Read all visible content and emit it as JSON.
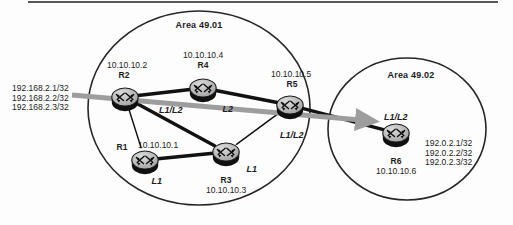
{
  "figure": {
    "type": "network-topology-diagram",
    "background": "#fdfdfd",
    "ink_color": "#1b1b1b",
    "link_color": "#111111",
    "arrow_color": "#9a9a9a",
    "router_body_color": "#b3b3b3",
    "router_shadow_color": "#101010"
  },
  "areas": [
    {
      "id": "area-49-01",
      "label": "Area 49.01",
      "cx": 199,
      "cy": 108,
      "rx": 111,
      "ry": 97,
      "label_x": 199,
      "label_y": 20
    },
    {
      "id": "area-49-02",
      "label": "Area 49.02",
      "cx": 407,
      "cy": 129,
      "rx": 79,
      "ry": 71,
      "label_x": 411,
      "label_y": 70
    }
  ],
  "routers": [
    {
      "id": "R1",
      "name": "R1",
      "x": 145,
      "y": 160,
      "name_x": 122,
      "name_y": 143,
      "ip": "10.10.10.1",
      "ip_x": 158,
      "ip_y": 141,
      "level": "L1",
      "level_x": 157,
      "level_y": 176
    },
    {
      "id": "R2",
      "name": "R2",
      "x": 125,
      "y": 97,
      "name_x": 124,
      "name_y": 71,
      "ip": "10.10.10.2",
      "ip_x": 127,
      "ip_y": 61,
      "level": "L1/L2",
      "level_x": 171,
      "level_y": 105
    },
    {
      "id": "R3",
      "name": "R3",
      "x": 226,
      "y": 152,
      "name_x": 226,
      "name_y": 176,
      "ip": "10.10.10.3",
      "ip_x": 226,
      "ip_y": 186,
      "level": "L1",
      "level_x": 252,
      "level_y": 164
    },
    {
      "id": "R4",
      "name": "R4",
      "x": 203,
      "y": 88,
      "name_x": 203,
      "name_y": 61,
      "ip": "10.10.10.4",
      "ip_x": 203,
      "ip_y": 51,
      "level": "L2",
      "level_x": 228,
      "level_y": 104
    },
    {
      "id": "R5",
      "name": "R5",
      "x": 290,
      "y": 105,
      "name_x": 292,
      "name_y": 80,
      "ip": "10.10.10.5",
      "ip_x": 291,
      "ip_y": 70,
      "level": "L1/L2",
      "level_x": 292,
      "level_y": 130
    },
    {
      "id": "R6",
      "name": "R6",
      "x": 396,
      "y": 133,
      "name_x": 396,
      "name_y": 157,
      "ip": "10.10.10.6",
      "ip_x": 396,
      "ip_y": 167,
      "level": "L1/L2",
      "level_x": 396,
      "level_y": 112
    }
  ],
  "links": [
    {
      "from": "R2",
      "to": "R4",
      "weight": "thick"
    },
    {
      "from": "R4",
      "to": "R5",
      "weight": "thick"
    },
    {
      "from": "R2",
      "to": "R1",
      "weight": "thin"
    },
    {
      "from": "R2",
      "to": "R3",
      "weight": "thick"
    },
    {
      "from": "R1",
      "to": "R3",
      "weight": "thick"
    },
    {
      "from": "R3",
      "to": "R5",
      "weight": "thin"
    },
    {
      "from": "R5",
      "to": "R6",
      "weight": "thick"
    }
  ],
  "prefix_blocks": [
    {
      "id": "left-prefixes",
      "align": "right",
      "x": 12,
      "y": 84,
      "lines": [
        "192.168.2.1/32",
        "192.168.2.2/32",
        "192.168.2.3/32"
      ]
    },
    {
      "id": "right-prefixes",
      "align": "left",
      "x": 425,
      "y": 139,
      "lines": [
        "192.0.2.1/32",
        "192.0.2.2/32",
        "192.0.2.3/32"
      ]
    }
  ],
  "flow_arrow": {
    "id": "route-leak-arrow",
    "label": "",
    "x1": 72,
    "y1": 95,
    "x2": 372,
    "y2": 121,
    "color": "#9d9d9d",
    "width": 5
  }
}
